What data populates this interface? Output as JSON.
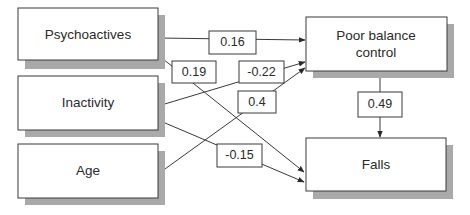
{
  "diagram": {
    "type": "path-diagram",
    "nodes": {
      "psychoactives": {
        "label": "Psychoactives"
      },
      "inactivity": {
        "label": "Inactivity"
      },
      "age": {
        "label": "Age"
      },
      "poor_balance": {
        "line1": "Poor balance",
        "line2": "control"
      },
      "falls": {
        "label": "Falls"
      }
    },
    "edges": [
      {
        "from": "Psychoactives",
        "to": "Poor balance control",
        "coefficient": "0.16"
      },
      {
        "from": "Psychoactives",
        "to": "Falls",
        "coefficient": "0.19"
      },
      {
        "from": "Inactivity",
        "to": "Poor balance control",
        "coefficient": "-0.22"
      },
      {
        "from": "Age",
        "to": "Poor balance control",
        "coefficient": "0.4"
      },
      {
        "from": "Poor balance control",
        "to": "Falls",
        "coefficient": "0.49"
      },
      {
        "from": "Inactivity",
        "to": "Falls",
        "coefficient": "-0.15"
      }
    ]
  }
}
